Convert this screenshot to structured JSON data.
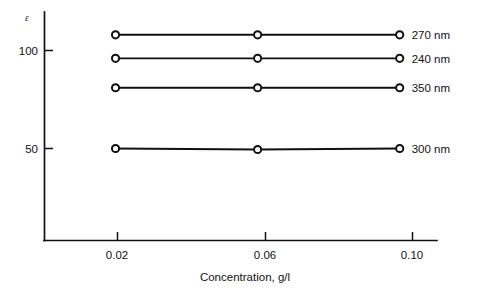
{
  "chart_data": {
    "type": "line",
    "title": "",
    "subtitle": "",
    "xlabel": "Concentration, g/l",
    "ylabel": "ε",
    "x": [
      0.02,
      0.06,
      0.1
    ],
    "xtick_labels": [
      "0.02",
      "0.06",
      "0.10"
    ],
    "ytick_labels": [
      "100",
      "50"
    ],
    "yticks": [
      100,
      50
    ],
    "xlim": [
      0.0,
      0.1105
    ],
    "ylim": [
      0,
      117
    ],
    "grid": false,
    "legend_position": "right-of-line-ends",
    "marker": "open-circle",
    "line_color": "#111111",
    "series": [
      {
        "name": "270 nm",
        "label": "270 nm",
        "values": [
          108,
          108,
          108
        ]
      },
      {
        "name": "240 nm",
        "label": "240 nm",
        "values": [
          96,
          96,
          96
        ]
      },
      {
        "name": "350 nm",
        "label": "350 nm",
        "values": [
          81,
          81,
          81
        ]
      },
      {
        "name": "300 nm",
        "label": "300 nm",
        "values": [
          50,
          49.5,
          50
        ]
      }
    ]
  },
  "axes": {
    "y_symbol": "ε",
    "x_title": "Concentration, g/l"
  }
}
